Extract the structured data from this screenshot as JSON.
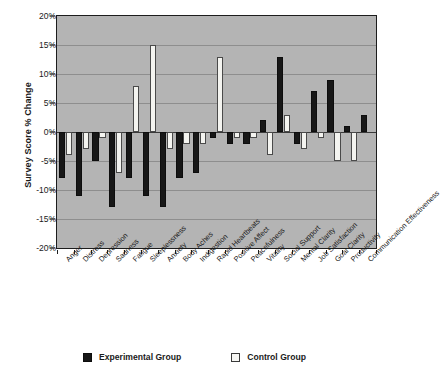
{
  "chart_data": {
    "type": "bar",
    "title": "",
    "xlabel": "",
    "ylabel": "Survey Score % Change",
    "ylim": [
      -20,
      20
    ],
    "ytick_values": [
      20,
      15,
      10,
      5,
      0,
      -5,
      -10,
      -15,
      -20
    ],
    "ytick_labels": [
      "20%",
      "15%",
      "10%",
      "5%",
      "0%",
      "-5%",
      "-10%",
      "-15%",
      "-20%"
    ],
    "grid": true,
    "legend_position": "bottom",
    "categories": [
      "Anger",
      "Distress",
      "Depression",
      "Sadness",
      "Fatigue",
      "Sleeplessness",
      "Anxiety",
      "Body Aches",
      "Indigestion",
      "Rapid Heartbeats",
      "Positive Affect",
      "Peacefulness",
      "Vitality",
      "Social Support",
      "Mental Clarity",
      "Job Satisfaction",
      "Goal Clarity",
      "Productivity",
      "Communication Effectiveness"
    ],
    "series": [
      {
        "name": "Experimental Group",
        "color": "#171717",
        "values": [
          -8,
          -11,
          -5,
          -13,
          -8,
          -11,
          -13,
          -8,
          -7,
          -1,
          -2,
          -2,
          2,
          13,
          -2,
          7,
          9,
          1,
          3
        ]
      },
      {
        "name": "Control Group",
        "color": "#f4f4f0",
        "values": [
          -4,
          -3,
          -1,
          -7,
          8,
          15,
          -3,
          -2,
          -2,
          13,
          -1,
          -1,
          -4,
          3,
          -3,
          -1,
          -5,
          -5,
          0
        ]
      }
    ]
  },
  "legend": {
    "items": [
      {
        "label": "Experimental Group",
        "swatch": "filled-black-square"
      },
      {
        "label": "Control Group",
        "swatch": "open-white-square"
      }
    ]
  }
}
